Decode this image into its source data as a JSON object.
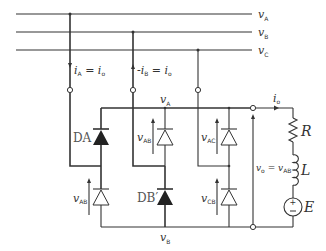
{
  "lines": [
    {
      "name": "v",
      "sub": "A"
    },
    {
      "name": "v",
      "sub": "B"
    },
    {
      "name": "v",
      "sub": "C"
    }
  ],
  "currents": {
    "phase_a": {
      "text": "i",
      "sub": "A",
      "rest": " = i",
      "sub2": "o"
    },
    "phase_b": {
      "text": "-i",
      "sub": "B",
      "rest": " = i",
      "sub2": "o"
    },
    "output": {
      "text": "i",
      "sub": "o"
    }
  },
  "buses": {
    "top": {
      "name": "v",
      "sub": "A"
    },
    "bottom": {
      "name": "v",
      "sub": "B"
    }
  },
  "diodes": {
    "upper": [
      {
        "label": "DA",
        "filled": true,
        "voltage": ""
      },
      {
        "label": "",
        "filled": false,
        "voltage": "v",
        "vsub": "AB"
      },
      {
        "label": "",
        "filled": false,
        "voltage": "v",
        "vsub": "AC"
      }
    ],
    "lower": [
      {
        "label": "",
        "filled": false,
        "voltage": "v",
        "vsub": "AB"
      },
      {
        "label": "DB′",
        "filled": true,
        "voltage": ""
      },
      {
        "label": "",
        "filled": false,
        "voltage": "v",
        "vsub": "CB"
      }
    ]
  },
  "output_voltage": {
    "left": "v",
    "lsub": "o",
    "eq": " = v",
    "rsub": "AB"
  },
  "load": {
    "resistor": "R",
    "inductor": "L",
    "source": "E"
  }
}
